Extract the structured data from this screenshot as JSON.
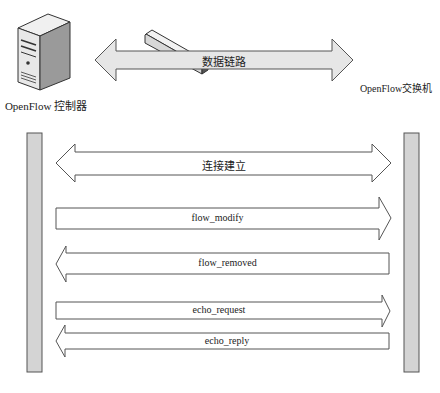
{
  "top": {
    "controller_label": "OpenFlow 控制器",
    "switch_label": "OpenFlow交换机",
    "link_label": "数据链路"
  },
  "messages": [
    {
      "label": "连接建立",
      "direction": "both"
    },
    {
      "label": "flow_modify",
      "direction": "to-switch"
    },
    {
      "label": "flow_removed",
      "direction": "to-controller"
    },
    {
      "label": "echo_request",
      "direction": "to-switch"
    },
    {
      "label": "echo_reply",
      "direction": "to-controller"
    }
  ],
  "colors": {
    "link_arrow_fill": "#e6e6e6",
    "lifeline_fill": "#d4d4d4",
    "stroke": "#555555"
  }
}
